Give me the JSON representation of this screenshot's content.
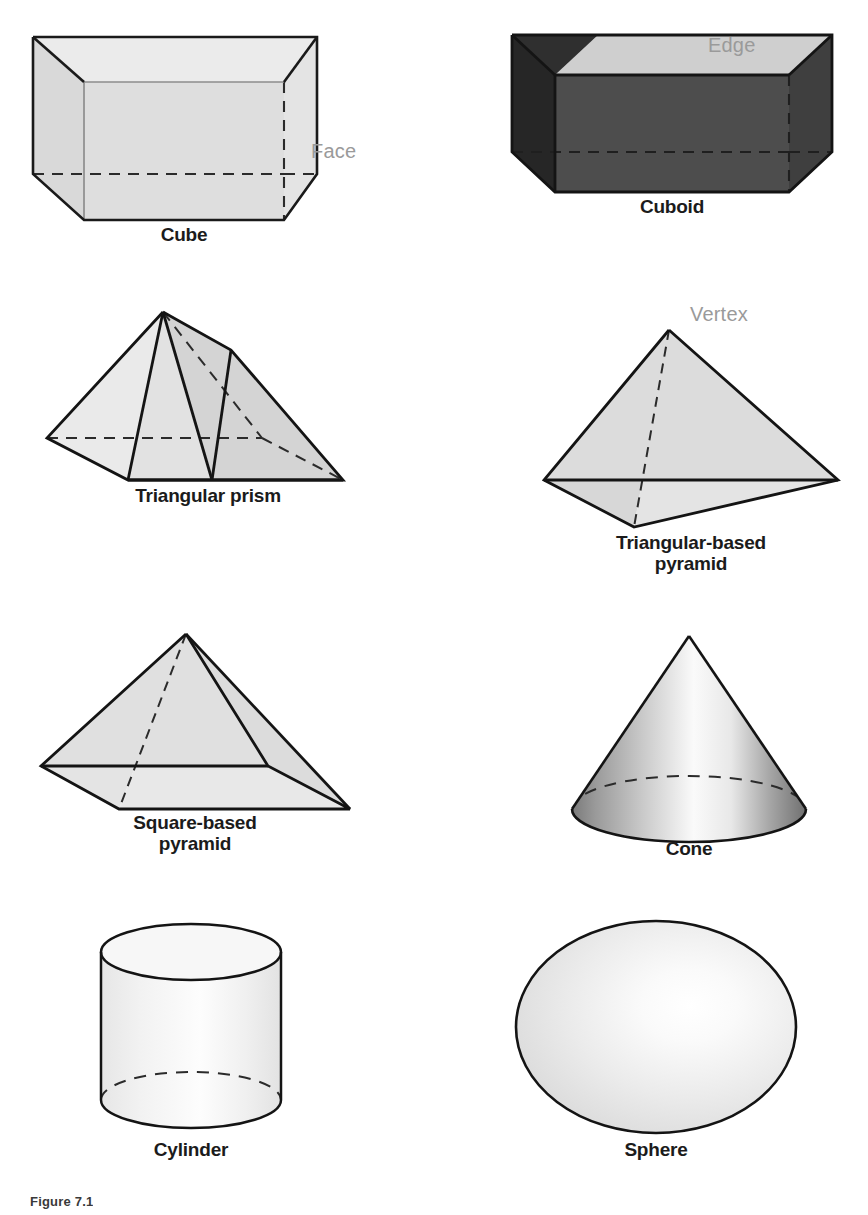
{
  "figure": {
    "caption": "Figure 7.1",
    "background_color": "#ffffff"
  },
  "colors": {
    "outline": "#1a1a1a",
    "hidden_edge": "#333333",
    "label_text": "#1b1b1b",
    "annotation_text": "#9a9a9a",
    "face_light": "#e0e0e0",
    "face_lighter": "#ededed",
    "face_mid": "#c8c8c8",
    "cuboid_top": "#cfcfcf",
    "cuboid_front": "#4a4a4a",
    "cuboid_side": "#2b2b2b",
    "cone_dark": "#6e6e6e",
    "cone_light": "#fbfbfb",
    "sphere_light": "#fdfdfd",
    "sphere_edge": "#cfcfcf",
    "cylinder_fill": "#f2f2f2"
  },
  "shapes": [
    {
      "id": "cube",
      "label": "Cube",
      "annotation": "Face",
      "annotation_target": "right face",
      "row": 1,
      "column": 1,
      "faces": 6,
      "edges": 12,
      "vertices": 8
    },
    {
      "id": "cuboid",
      "label": "Cuboid",
      "annotation": "Edge",
      "annotation_target": "top back edge",
      "row": 1,
      "column": 2,
      "faces": 6,
      "edges": 12,
      "vertices": 8
    },
    {
      "id": "triangular-prism",
      "label": "Triangular prism",
      "annotation": null,
      "row": 2,
      "column": 1,
      "faces": 5,
      "edges": 9,
      "vertices": 6
    },
    {
      "id": "triangular-based-pyramid",
      "label": "Triangular-based\npyramid",
      "annotation": "Vertex",
      "annotation_target": "apex",
      "row": 2,
      "column": 2,
      "faces": 4,
      "edges": 6,
      "vertices": 4
    },
    {
      "id": "square-based-pyramid",
      "label": "Square-based\npyramid",
      "annotation": null,
      "row": 3,
      "column": 1,
      "faces": 5,
      "edges": 8,
      "vertices": 5
    },
    {
      "id": "cone",
      "label": "Cone",
      "annotation": null,
      "row": 3,
      "column": 2,
      "faces": 2,
      "edges": 1,
      "vertices": 1
    },
    {
      "id": "cylinder",
      "label": "Cylinder",
      "annotation": null,
      "row": 4,
      "column": 1,
      "faces": 3,
      "edges": 2,
      "vertices": 0
    },
    {
      "id": "sphere",
      "label": "Sphere",
      "annotation": null,
      "row": 4,
      "column": 2,
      "faces": 1,
      "edges": 0,
      "vertices": 0
    }
  ]
}
